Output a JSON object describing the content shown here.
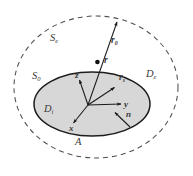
{
  "figure": {
    "type": "geometry-diagram",
    "background_color": "#ffffff",
    "ink_color": "#3a3a3a",
    "inner_fill_color": "#d6d6d6",
    "inner_stroke_color": "#1a1a1a",
    "outer_stroke_color": "#555555"
  },
  "labels": {
    "outer_surface": {
      "base": "S",
      "sub": "e"
    },
    "inner_surface": {
      "base": "S",
      "sub": "0"
    },
    "exterior_domain": {
      "base": "D",
      "sub": "e"
    },
    "interior_domain": {
      "base": "D",
      "sub": "i"
    },
    "area": {
      "base": "A",
      "sub": ""
    },
    "vector_r0": {
      "base": "r",
      "sub": "0"
    },
    "vector_r": {
      "base": "r",
      "sub": ""
    },
    "vector_rs": {
      "base": "r",
      "sub": "s"
    },
    "axis_x": {
      "base": "x",
      "sub": ""
    },
    "axis_y": {
      "base": "y",
      "sub": ""
    },
    "axis_z": {
      "base": "z",
      "sub": ""
    },
    "normal_n": {
      "base": "n",
      "sub": ""
    }
  },
  "geometry": {
    "outer_ellipse": {
      "cx": 96,
      "cy": 87,
      "rx": 82,
      "ry": 71,
      "dash": "5 4"
    },
    "inner_ellipse": {
      "cx": 92,
      "cy": 104,
      "rx": 58,
      "ry": 32
    },
    "origin": {
      "x": 88,
      "y": 105
    },
    "r0_tip": {
      "x": 117,
      "y": 21
    },
    "r_point": {
      "x": 97,
      "y": 62
    },
    "rs_tip": {
      "x": 114,
      "y": 87
    },
    "n_tail": {
      "x": 130,
      "y": 127
    },
    "n_tip": {
      "x": 114,
      "y": 112
    },
    "axis_x_tip": {
      "x": 73,
      "y": 124
    },
    "axis_y_tip": {
      "x": 122,
      "y": 104
    },
    "axis_z_tip": {
      "x": 79,
      "y": 79
    }
  }
}
